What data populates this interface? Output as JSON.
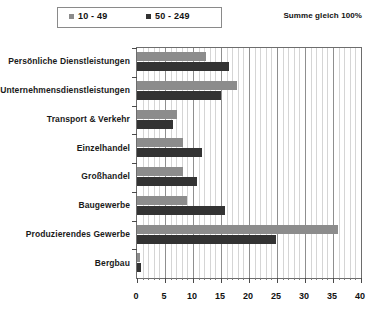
{
  "legend": {
    "entries": [
      {
        "label": "10 - 49",
        "color": "#8c8c8c",
        "icon": "square-marker-icon"
      },
      {
        "label": "50 - 249",
        "color": "#333333",
        "icon": "square-marker-icon"
      }
    ]
  },
  "note": "Summe gleich 100%",
  "chart_data": {
    "type": "bar",
    "orientation": "horizontal",
    "title": "",
    "subtitle": "",
    "xlabel": "",
    "ylabel": "",
    "xlim": [
      0,
      40
    ],
    "xticks": [
      0,
      5,
      10,
      15,
      20,
      25,
      30,
      35,
      40
    ],
    "minor_tick_step": 1,
    "grid": true,
    "grid_axis": "x",
    "legend_position": "top-left",
    "categories": [
      "Persönliche Dienstleistungen",
      "Unternehmensdienstleistungen",
      "Transport & Verkehr",
      "Einzelhandel",
      "Großhandel",
      "Baugewerbe",
      "Produzierendes Gewerbe",
      "Bergbau"
    ],
    "series": [
      {
        "name": "10 - 49",
        "color": "#8c8c8c",
        "values": [
          12.3,
          17.8,
          7.2,
          8.3,
          8.3,
          9.0,
          35.9,
          0.6
        ]
      },
      {
        "name": "50 - 249",
        "color": "#333333",
        "values": [
          16.4,
          15.0,
          6.4,
          11.6,
          10.7,
          15.8,
          24.9,
          0.8
        ]
      }
    ]
  },
  "colors": {
    "series_light": "#8c8c8c",
    "series_dark": "#333333",
    "frame": "#6d6d6d",
    "grid_minor": "#d5d5d5",
    "grid_major": "#8f8f8f"
  }
}
